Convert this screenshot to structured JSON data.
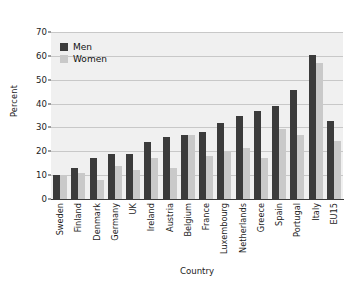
{
  "chart_data": {
    "type": "bar",
    "title": "",
    "xlabel": "Country",
    "ylabel": "Percent",
    "ylim": [
      0,
      70
    ],
    "yticks": [
      0,
      10,
      20,
      30,
      40,
      50,
      60,
      70
    ],
    "grid": true,
    "legend_position": "top-left",
    "categories": [
      "Sweden",
      "Finland",
      "Denmark",
      "Germany",
      "UK",
      "Ireland",
      "Austria",
      "Belgium",
      "France",
      "Luxembourg",
      "Netherlands",
      "Greece",
      "Spain",
      "Portugal",
      "Italy",
      "EU15"
    ],
    "series": [
      {
        "name": "Men",
        "color": "#3b3b3b",
        "values": [
          10,
          13,
          17,
          19,
          19,
          24,
          26,
          27,
          28,
          32,
          35,
          37,
          39,
          45.5,
          60.5,
          32.5
        ]
      },
      {
        "name": "Women",
        "color": "#c9c9c9",
        "values": [
          10,
          11,
          8,
          14,
          12,
          17,
          13,
          27,
          18,
          20,
          21.5,
          17,
          29.5,
          27,
          57,
          24.5
        ]
      }
    ]
  }
}
